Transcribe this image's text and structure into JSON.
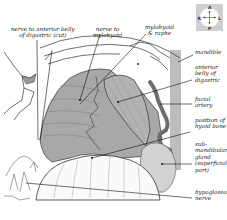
{
  "figure": {
    "colors": {
      "background": "#ffffff",
      "muscle_fill": "#a8a8a8",
      "muscle_dark": "#8e8e8e",
      "gland_fill": "#d2d2d2",
      "artery_fill": "#6e6e6e",
      "mandible_bar": "#bdbdbd",
      "line": "#222222"
    }
  },
  "compass": {
    "top": "A",
    "bottom": "P",
    "left": "R",
    "right": "L"
  },
  "labels": {
    "top": [
      {
        "id": "nerve-to-anterior-belly",
        "text": "nerve to anterior belly\nof digastric (cut)"
      },
      {
        "id": "nerve-to-mylohyoid",
        "text": "nerve to\nmylohyoid"
      },
      {
        "id": "mylohyoid-raphe",
        "text": "mylohyoid\n& raphe"
      }
    ],
    "right": [
      {
        "id": "mandible",
        "text": "mandible"
      },
      {
        "id": "anterior-belly-digastric",
        "text": "anterior\nbelly of\ndigastric"
      },
      {
        "id": "facial-artery",
        "text": "facial\nartery"
      },
      {
        "id": "hyoid-bone",
        "text": "position of\nhyoid bone"
      },
      {
        "id": "submandibular-gland",
        "text": "sub-\nmandibular\ngland\n(superficial\npart)"
      },
      {
        "id": "hypoglossal-nerve",
        "text": "hypoglossal\nnerve"
      }
    ]
  }
}
